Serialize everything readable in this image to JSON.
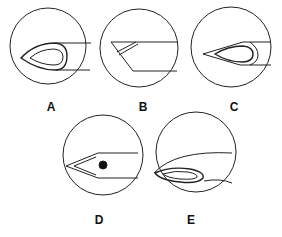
{
  "figure": {
    "panels": [
      {
        "label": "A",
        "description": "Needle tip with teardrop-shaped bevel opening, shaft extending right"
      },
      {
        "label": "B",
        "description": "Needle side view with slanted bevel cut and narrow lumen line"
      },
      {
        "label": "C",
        "description": "Needle tip with long pointed bevel and inner teardrop opening"
      },
      {
        "label": "D",
        "description": "Closed conical pencil-point tip with side port (dot)"
      },
      {
        "label": "E",
        "description": "Curved tip with elongated oval side opening"
      }
    ],
    "stroke_color": "#222222",
    "background": "#ffffff"
  }
}
